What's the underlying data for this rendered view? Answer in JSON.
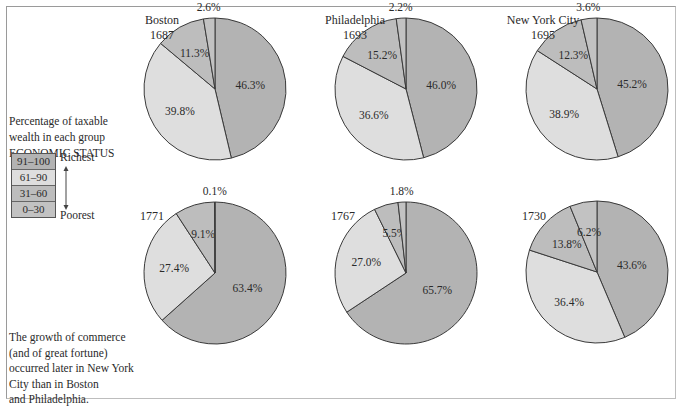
{
  "colors": {
    "g91_100": "#b3b3b3",
    "g61_90": "#dedede",
    "g31_60": "#bdbdbd",
    "g0_30": "#c2c2c2",
    "stroke": "#3a3a3a"
  },
  "legend": {
    "caption_line1": "Percentage of taxable",
    "caption_line2": "wealth in each group",
    "caption_line3": "ECONOMIC STATUS",
    "rows": [
      {
        "label": "91–100",
        "key": "g91_100"
      },
      {
        "label": "61–90",
        "key": "g61_90"
      },
      {
        "label": "31–60",
        "key": "g31_60"
      },
      {
        "label": "0–30",
        "key": "g0_30"
      }
    ],
    "richest": "Richest",
    "poorest": "Poorest"
  },
  "footnote": {
    "line1": "The growth of commerce",
    "line2": "(and of great fortune)",
    "line3": "occurred later in New York",
    "line4": "City than in Boston",
    "line5": "and Philadelphia."
  },
  "labels": {
    "boston_city": "Boston",
    "boston_1687": "1687",
    "phila_city": "Philadelphia",
    "phila_1693": "1693",
    "nyc_city": "New York City",
    "nyc_1695": "1695",
    "boston_1771": "1771",
    "phila_1767": "1767",
    "nyc_1730": "1730"
  },
  "chart_data": [
    {
      "type": "pie",
      "title": "Boston 1687",
      "categories": [
        "91–100",
        "61–90",
        "31–60",
        "0–30"
      ],
      "values": [
        46.3,
        39.8,
        11.3,
        2.6
      ]
    },
    {
      "type": "pie",
      "title": "Philadelphia 1693",
      "categories": [
        "91–100",
        "61–90",
        "31–60",
        "0–30"
      ],
      "values": [
        46.0,
        36.6,
        15.2,
        2.2
      ]
    },
    {
      "type": "pie",
      "title": "New York City 1695",
      "categories": [
        "91–100",
        "61–90",
        "31–60",
        "0–30"
      ],
      "values": [
        45.2,
        38.9,
        12.3,
        3.6
      ]
    },
    {
      "type": "pie",
      "title": "Boston 1771",
      "categories": [
        "91–100",
        "61–90",
        "31–60",
        "0–30"
      ],
      "values": [
        63.4,
        27.4,
        9.1,
        0.1
      ]
    },
    {
      "type": "pie",
      "title": "Philadelphia 1767",
      "categories": [
        "91–100",
        "61–90",
        "31–60",
        "0–30"
      ],
      "values": [
        65.7,
        27.0,
        5.5,
        1.8
      ]
    },
    {
      "type": "pie",
      "title": "New York City 1730",
      "categories": [
        "91–100",
        "61–90",
        "31–60",
        "0–30"
      ],
      "values": [
        43.6,
        36.4,
        13.8,
        6.2
      ]
    }
  ],
  "pie_layout": [
    {
      "cx": 215,
      "cy": 89,
      "r": 71
    },
    {
      "cx": 406,
      "cy": 89,
      "r": 71
    },
    {
      "cx": 597,
      "cy": 89,
      "r": 71
    },
    {
      "cx": 215,
      "cy": 273,
      "r": 71
    },
    {
      "cx": 406,
      "cy": 273,
      "r": 71
    },
    {
      "cx": 597,
      "cy": 272,
      "r": 71
    }
  ]
}
